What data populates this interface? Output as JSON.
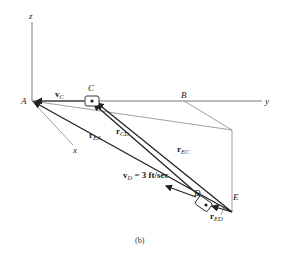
{
  "figure": {
    "caption": "(b)",
    "axes": {
      "z": "z",
      "y": "y",
      "x": "x"
    },
    "points": {
      "A": "A",
      "B": "B",
      "C": "C",
      "D": "D",
      "E": "E"
    },
    "vectors": {
      "vC": {
        "main": "v",
        "sub": "C"
      },
      "rEA": {
        "main": "r",
        "sub": "EA"
      },
      "rCD": {
        "main": "r",
        "sub": "CD"
      },
      "rEC": {
        "main": "r",
        "sub": "EC"
      },
      "rED": {
        "main": "r",
        "sub": "ED"
      },
      "vD": {
        "main": "v",
        "sub": "D",
        "value": " = 3 ft/sec"
      }
    },
    "colors": {
      "line": "#222222",
      "thin": "#777777",
      "background": "#ffffff"
    }
  }
}
